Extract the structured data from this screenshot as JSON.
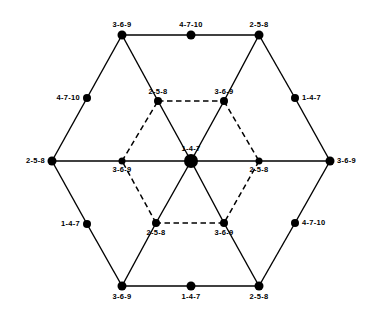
{
  "figure": {
    "type": "node-link-diagram",
    "width": 380,
    "height": 314,
    "background_color": "#ffffff",
    "line_color": "#000000",
    "node_color": "#000000"
  },
  "legend_values": {
    "triple_a": "1-4-7",
    "triple_b": "2-5-8",
    "triple_c": "3-6-9",
    "triple_d": "4-7-10"
  },
  "nodes": [
    {
      "id": "outer-top-left",
      "label": "3-6-9",
      "x": 122,
      "y": 35,
      "r": 4.5,
      "label_pos": "above",
      "label_dx": 0,
      "label_dy": -7,
      "group": "outer-vertex"
    },
    {
      "id": "outer-top-mid",
      "label": "4-7-10",
      "x": 191,
      "y": 35,
      "r": 4.5,
      "label_pos": "above",
      "label_dx": 0,
      "label_dy": -7,
      "group": "edge-midpoint"
    },
    {
      "id": "outer-top-right",
      "label": "2-5-8",
      "x": 259,
      "y": 35,
      "r": 4.5,
      "label_pos": "above",
      "label_dx": 0,
      "label_dy": -7,
      "group": "outer-vertex"
    },
    {
      "id": "outer-upper-left",
      "label": "4-7-10",
      "x": 87,
      "y": 98,
      "r": 4.0,
      "label_pos": "left",
      "label_dx": -7,
      "label_dy": 0,
      "group": "edge-midpoint"
    },
    {
      "id": "outer-upper-right",
      "label": "1-4-7",
      "x": 295,
      "y": 98,
      "r": 4.0,
      "label_pos": "right",
      "label_dx": 7,
      "label_dy": 0,
      "group": "edge-midpoint"
    },
    {
      "id": "outer-left",
      "label": "2-5-8",
      "x": 52,
      "y": 161,
      "r": 4.5,
      "label_pos": "left",
      "label_dx": -7,
      "label_dy": 0,
      "group": "outer-vertex"
    },
    {
      "id": "outer-right",
      "label": "3-6-9",
      "x": 330,
      "y": 161,
      "r": 4.5,
      "label_pos": "right",
      "label_dx": 7,
      "label_dy": 0,
      "group": "outer-vertex"
    },
    {
      "id": "outer-lower-left",
      "label": "1-4-7",
      "x": 87,
      "y": 224,
      "r": 4.0,
      "label_pos": "left",
      "label_dx": -7,
      "label_dy": 0,
      "group": "edge-midpoint"
    },
    {
      "id": "outer-lower-right",
      "label": "4-7-10",
      "x": 295,
      "y": 223,
      "r": 4.0,
      "label_pos": "right",
      "label_dx": 7,
      "label_dy": 0,
      "group": "edge-midpoint"
    },
    {
      "id": "outer-bottom-left",
      "label": "3-6-9",
      "x": 122,
      "y": 286,
      "r": 4.5,
      "label_pos": "below",
      "label_dx": 0,
      "label_dy": 7,
      "group": "outer-vertex"
    },
    {
      "id": "outer-bottom-mid",
      "label": "1-4-7",
      "x": 191,
      "y": 286,
      "r": 4.5,
      "label_pos": "below",
      "label_dx": 0,
      "label_dy": 7,
      "group": "edge-midpoint"
    },
    {
      "id": "outer-bottom-right",
      "label": "2-5-8",
      "x": 259,
      "y": 286,
      "r": 4.5,
      "label_pos": "below",
      "label_dx": 0,
      "label_dy": 7,
      "group": "outer-vertex"
    },
    {
      "id": "inner-top-left",
      "label": "2-5-8",
      "x": 158,
      "y": 101,
      "r": 4.0,
      "label_pos": "above",
      "label_dx": 0,
      "label_dy": -6,
      "group": "inner-vertex"
    },
    {
      "id": "inner-top-right",
      "label": "3-6-9",
      "x": 224,
      "y": 101,
      "r": 4.0,
      "label_pos": "above",
      "label_dx": 0,
      "label_dy": -6,
      "group": "inner-vertex"
    },
    {
      "id": "inner-left",
      "label": "3-6-9",
      "x": 122,
      "y": 161,
      "r": 3.5,
      "label_pos": "below",
      "label_dx": 0,
      "label_dy": 5,
      "group": "inner-vertex"
    },
    {
      "id": "inner-right",
      "label": "2-5-8",
      "x": 259,
      "y": 161,
      "r": 3.5,
      "label_pos": "below",
      "label_dx": 0,
      "label_dy": 5,
      "group": "inner-vertex"
    },
    {
      "id": "inner-bottom-left",
      "label": "2-5-8",
      "x": 156,
      "y": 223,
      "r": 4.0,
      "label_pos": "below",
      "label_dx": 0,
      "label_dy": 6,
      "group": "inner-vertex"
    },
    {
      "id": "inner-bottom-right",
      "label": "3-6-9",
      "x": 224,
      "y": 223,
      "r": 4.0,
      "label_pos": "below",
      "label_dx": 0,
      "label_dy": 6,
      "group": "inner-vertex"
    },
    {
      "id": "center",
      "label": "1-4-7",
      "x": 191,
      "y": 161,
      "r": 7.0,
      "label_pos": "above",
      "label_dx": 0,
      "label_dy": -9,
      "group": "center"
    }
  ],
  "edges": [
    {
      "from": "outer-top-left",
      "to": "outer-top-mid",
      "style": "solid"
    },
    {
      "from": "outer-top-mid",
      "to": "outer-top-right",
      "style": "solid"
    },
    {
      "from": "outer-top-left",
      "to": "outer-upper-left",
      "style": "solid"
    },
    {
      "from": "outer-upper-left",
      "to": "outer-left",
      "style": "solid"
    },
    {
      "from": "outer-top-right",
      "to": "outer-upper-right",
      "style": "solid"
    },
    {
      "from": "outer-upper-right",
      "to": "outer-right",
      "style": "solid"
    },
    {
      "from": "outer-left",
      "to": "outer-lower-left",
      "style": "solid"
    },
    {
      "from": "outer-lower-left",
      "to": "outer-bottom-left",
      "style": "solid"
    },
    {
      "from": "outer-right",
      "to": "outer-lower-right",
      "style": "solid"
    },
    {
      "from": "outer-lower-right",
      "to": "outer-bottom-right",
      "style": "solid"
    },
    {
      "from": "outer-bottom-left",
      "to": "outer-bottom-mid",
      "style": "solid"
    },
    {
      "from": "outer-bottom-mid",
      "to": "outer-bottom-right",
      "style": "solid"
    },
    {
      "from": "outer-left",
      "to": "inner-left",
      "style": "solid"
    },
    {
      "from": "inner-left",
      "to": "center",
      "style": "solid"
    },
    {
      "from": "center",
      "to": "inner-right",
      "style": "solid"
    },
    {
      "from": "inner-right",
      "to": "outer-right",
      "style": "solid"
    },
    {
      "from": "outer-top-left",
      "to": "inner-top-left",
      "style": "solid"
    },
    {
      "from": "inner-top-left",
      "to": "center",
      "style": "solid"
    },
    {
      "from": "outer-top-right",
      "to": "inner-top-right",
      "style": "solid"
    },
    {
      "from": "inner-top-right",
      "to": "center",
      "style": "solid"
    },
    {
      "from": "outer-bottom-left",
      "to": "inner-bottom-left",
      "style": "solid"
    },
    {
      "from": "inner-bottom-left",
      "to": "center",
      "style": "solid"
    },
    {
      "from": "outer-bottom-right",
      "to": "inner-bottom-right",
      "style": "solid"
    },
    {
      "from": "inner-bottom-right",
      "to": "center",
      "style": "solid"
    },
    {
      "from": "inner-top-left",
      "to": "inner-top-right",
      "style": "dashed"
    },
    {
      "from": "inner-top-right",
      "to": "inner-right",
      "style": "dashed"
    },
    {
      "from": "inner-right",
      "to": "inner-bottom-right",
      "style": "dashed"
    },
    {
      "from": "inner-bottom-right",
      "to": "inner-bottom-left",
      "style": "dashed"
    },
    {
      "from": "inner-bottom-left",
      "to": "inner-left",
      "style": "dashed"
    },
    {
      "from": "inner-left",
      "to": "inner-top-left",
      "style": "dashed"
    }
  ]
}
